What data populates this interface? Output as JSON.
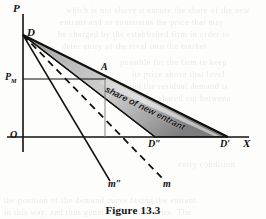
{
  "figure": {
    "caption": "Figure 13.3",
    "axes": {
      "y_axis_label": "P",
      "x_axis_label": "X",
      "origin_label": "O"
    },
    "points": [
      {
        "id": "apex",
        "label": "D",
        "x": 23,
        "y": 35,
        "name": "point-d"
      },
      {
        "id": "price",
        "label": "P",
        "sub": "M",
        "x": 23,
        "y": 79,
        "name": "point-pm"
      },
      {
        "id": "a",
        "label": "A",
        "x": 105,
        "y": 79,
        "name": "point-a"
      },
      {
        "id": "d_double",
        "label": "D″",
        "x": 155,
        "y": 137,
        "name": "point-d-double-prime"
      },
      {
        "id": "d_prime",
        "label": "D′",
        "x": 228,
        "y": 137,
        "name": "point-d-prime"
      }
    ],
    "curves": [
      {
        "id": "outer_demand",
        "label": "",
        "style": "solid",
        "from": "D",
        "to": "D′",
        "name": "outer-demand-curve"
      },
      {
        "id": "inner_demand",
        "label": "",
        "style": "solid",
        "from": "D",
        "to": "D″",
        "name": "inner-demand-curve"
      },
      {
        "id": "mr_double",
        "label": "m″",
        "style": "solid",
        "name": "marginal-revenue-m-double-prime"
      },
      {
        "id": "mr",
        "label": "m",
        "style": "dashed",
        "name": "marginal-revenue-m"
      }
    ],
    "shaded_region": {
      "label": "share of new entrant",
      "fill_color": "#a8a8a8",
      "edge_color": "#1a1a1a"
    },
    "guide_lines": [
      {
        "id": "price_line",
        "orientation": "horizontal",
        "name": "price-guide-line"
      },
      {
        "id": "quantity_line",
        "orientation": "vertical",
        "name": "quantity-guide-line"
      }
    ],
    "colors": {
      "ink": "#111111",
      "paper": "#fdfdfb",
      "shade": "#a8a8a8"
    }
  },
  "background_bleed": {
    "note": "faint show-through text from reverse page",
    "lines": [
      "which is not above it ensure the share of the new",
      "entrant and so constrains the price that may",
      "be charged by the established firm in order to",
      "deter entry of the rival into the market"
    ]
  }
}
